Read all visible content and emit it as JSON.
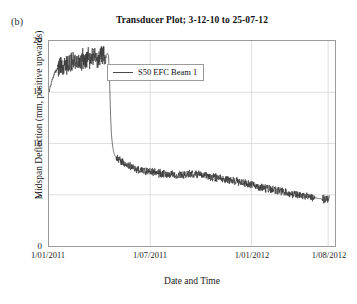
{
  "figure": {
    "panel_label": "(b)",
    "title": "Transducer Plot; 3-12-10 to 25-07-12"
  },
  "axes": {
    "ylabel": "Midspan Deflection (mm, positive upwards)",
    "xlabel": "Date and Time",
    "yticks": [
      "0",
      "5",
      "10",
      "15",
      "20"
    ],
    "xticks": [
      "1/01/2011",
      "1/07/2011",
      "1/01/2012",
      "1/08/2012"
    ]
  },
  "legend": {
    "entries": [
      {
        "label": "S50 EFC Beam 1",
        "color": "#4a4a4a"
      }
    ]
  },
  "colors": {
    "series": "#3a3a3a",
    "frame": "#9b9b9b",
    "grid": "#d8d8d8",
    "background": "#ffffff"
  },
  "chart_data": {
    "type": "line",
    "title": "Transducer Plot; 3-12-10 to 25-07-12",
    "xlabel": "Date and Time",
    "ylabel": "Midspan Deflection (mm, positive upwards)",
    "grid": true,
    "legend_position": "upper-center",
    "xlim": [
      0,
      1.0
    ],
    "ylim": [
      0,
      20
    ],
    "ytick_values": [
      0,
      5,
      10,
      15,
      20
    ],
    "xtick_labels": [
      "1/01/2011",
      "1/07/2011",
      "1/01/2012",
      "1/08/2012"
    ],
    "xtick_positions": [
      0.0,
      0.354,
      0.708,
      0.976
    ],
    "series": [
      {
        "name": "S50 EFC Beam 1",
        "color": "#3a3a3a",
        "description": "Midspan deflection rises from ~15 mm at 1/01/2011 to a noisy plateau near 17.5-19 mm, drops abruptly to ~8.5 mm in late March 2011, then decays gradually with daily noise to ~4.5 mm by 1/08/2012.",
        "noise_amplitude": [
          0.9,
          0.35
        ],
        "x": [
          0.0,
          0.005,
          0.012,
          0.02,
          0.03,
          0.04,
          0.05,
          0.06,
          0.07,
          0.08,
          0.09,
          0.1,
          0.11,
          0.12,
          0.13,
          0.14,
          0.15,
          0.16,
          0.17,
          0.18,
          0.19,
          0.2,
          0.205,
          0.208,
          0.212,
          0.215,
          0.218,
          0.222,
          0.226,
          0.23,
          0.24,
          0.25,
          0.26,
          0.27,
          0.28,
          0.3,
          0.32,
          0.34,
          0.36,
          0.38,
          0.4,
          0.42,
          0.44,
          0.46,
          0.48,
          0.5,
          0.52,
          0.54,
          0.56,
          0.58,
          0.6,
          0.62,
          0.64,
          0.66,
          0.68,
          0.7,
          0.72,
          0.74,
          0.76,
          0.78,
          0.8,
          0.82,
          0.84,
          0.86,
          0.88,
          0.9,
          0.92,
          0.94,
          0.96,
          0.98
        ],
        "y": [
          15.0,
          15.6,
          16.3,
          16.9,
          17.3,
          17.5,
          17.6,
          17.7,
          17.8,
          17.9,
          18.0,
          18.1,
          18.15,
          18.2,
          18.25,
          18.3,
          18.35,
          18.4,
          18.45,
          18.5,
          18.6,
          18.7,
          18.8,
          18.6,
          16.0,
          13.0,
          11.0,
          9.8,
          9.2,
          8.8,
          8.5,
          8.3,
          8.1,
          7.95,
          7.8,
          7.6,
          7.45,
          7.3,
          7.2,
          7.1,
          7.05,
          7.0,
          6.95,
          6.95,
          7.0,
          7.05,
          7.0,
          6.9,
          6.8,
          6.7,
          6.6,
          6.5,
          6.4,
          6.3,
          6.15,
          6.0,
          5.85,
          5.7,
          5.6,
          5.5,
          5.4,
          5.3,
          5.15,
          5.05,
          4.95,
          4.85,
          4.75,
          4.65,
          4.55,
          4.5
        ]
      }
    ]
  }
}
